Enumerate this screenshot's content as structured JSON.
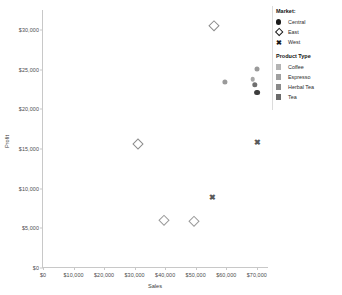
{
  "chart_data": {
    "type": "scatter",
    "title": "",
    "xlabel": "Sales",
    "ylabel": "Profit",
    "xlim": [
      0,
      74000
    ],
    "ylim": [
      0,
      32500
    ],
    "grid": false,
    "x_ticks": [
      "$0",
      "$10,000",
      "$20,000",
      "$30,000",
      "$40,000",
      "$50,000",
      "$60,000",
      "$70,000"
    ],
    "x_tick_values": [
      0,
      10000,
      20000,
      30000,
      40000,
      50000,
      60000,
      70000
    ],
    "y_ticks": [
      "$0",
      "$5,000",
      "$10,000",
      "$15,000",
      "$20,000",
      "$25,000",
      "$30,000"
    ],
    "y_tick_values": [
      0,
      5000,
      10000,
      15000,
      20000,
      25000,
      30000
    ],
    "legend_position": "right",
    "points": [
      {
        "x": 56000,
        "y": 30500,
        "market": "East",
        "product": "Coffee",
        "shape": "diamond",
        "color": "#8c8c8c",
        "size": 6.2
      },
      {
        "x": 70200,
        "y": 25100,
        "market": "Central",
        "product": "Tea",
        "shape": "circle",
        "color": "#9a9a9a",
        "size": 5.0
      },
      {
        "x": 68600,
        "y": 23800,
        "market": "Central",
        "product": "Espresso",
        "shape": "circle",
        "color": "#a8a8a8",
        "size": 4.6
      },
      {
        "x": 69400,
        "y": 23100,
        "market": "Central",
        "product": "Herbal Tea",
        "shape": "circle",
        "color": "#6f6f6f",
        "size": 5.4
      },
      {
        "x": 70000,
        "y": 22100,
        "market": "Central",
        "product": "Coffee",
        "shape": "circle",
        "color": "#3d3d3d",
        "size": 5.8
      },
      {
        "x": 59500,
        "y": 23400,
        "market": "Central",
        "product": "Espresso",
        "shape": "circle",
        "color": "#9a9a9a",
        "size": 5.2
      },
      {
        "x": 70000,
        "y": 15800,
        "market": "West",
        "product": "Coffee",
        "shape": "cross",
        "color": "#5a5a5a",
        "size": 6.5
      },
      {
        "x": 31000,
        "y": 15600,
        "market": "East",
        "product": "Herbal Tea",
        "shape": "diamond",
        "color": "#8c8c8c",
        "size": 6.0
      },
      {
        "x": 55500,
        "y": 8800,
        "market": "West",
        "product": "Tea",
        "shape": "cross",
        "color": "#5a5a5a",
        "size": 6.2
      },
      {
        "x": 39500,
        "y": 6100,
        "market": "East",
        "product": "Espresso",
        "shape": "diamond",
        "color": "#9a9a9a",
        "size": 5.6
      },
      {
        "x": 49500,
        "y": 5900,
        "market": "East",
        "product": "Tea",
        "shape": "diamond",
        "color": "#9a9a9a",
        "size": 5.6
      }
    ]
  },
  "legend": {
    "market": {
      "title": "Market:",
      "items": [
        {
          "label": "Central",
          "key": "filled-circle"
        },
        {
          "label": "East",
          "key": "open-diamond"
        },
        {
          "label": "West",
          "key": "cross"
        }
      ]
    },
    "product_type": {
      "title": "Product Type",
      "items": [
        {
          "label": "Coffee",
          "swatch": "#b4b4b4"
        },
        {
          "label": "Espresso",
          "swatch": "#a0a0a0"
        },
        {
          "label": "Herbal Tea",
          "swatch": "#8a8a8a"
        },
        {
          "label": "Tea",
          "swatch": "#6b6b6b"
        }
      ]
    }
  }
}
